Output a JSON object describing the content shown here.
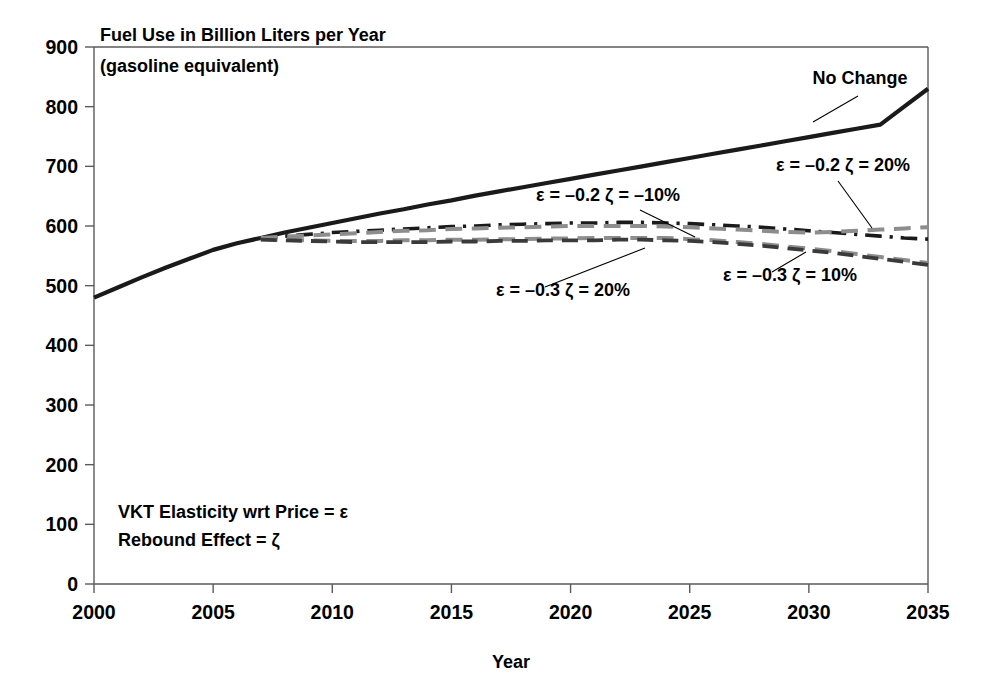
{
  "chart_data": {
    "type": "line",
    "title": "Fuel Use in Billion Liters per Year",
    "subtitle": "(gasoline equivalent)",
    "xlabel": "Year",
    "ylabel": "",
    "xlim": [
      2000,
      2035
    ],
    "ylim": [
      0,
      900
    ],
    "grid": false,
    "legend_position": "inline-annotations",
    "x_ticks": [
      "2000",
      "2005",
      "2010",
      "2015",
      "2020",
      "2025",
      "2030",
      "2035"
    ],
    "y_ticks": [
      "0",
      "100",
      "200",
      "300",
      "400",
      "500",
      "600",
      "700",
      "800",
      "900"
    ],
    "x": [
      2000,
      2001,
      2002,
      2003,
      2004,
      2005,
      2006,
      2007,
      2008,
      2009,
      2010,
      2011,
      2012,
      2013,
      2014,
      2015,
      2016,
      2017,
      2018,
      2019,
      2020,
      2021,
      2022,
      2023,
      2024,
      2025,
      2026,
      2027,
      2028,
      2029,
      2030,
      2031,
      2032,
      2033,
      2034,
      2035
    ],
    "series": [
      {
        "name": "No Change",
        "color": "#1a1a1a",
        "style": "solid",
        "width": 4.2,
        "values": [
          480,
          497,
          514,
          530,
          545,
          560,
          571,
          580,
          589,
          597,
          605,
          613,
          621,
          628,
          636,
          643,
          651,
          658,
          665,
          672,
          679,
          686,
          693,
          700,
          707,
          714,
          721,
          728,
          735,
          742,
          749,
          756,
          763,
          770,
          800,
          830
        ]
      },
      {
        "name": "ε = –0.2 ζ = –10%",
        "color": "#1a1a1a",
        "style": "dashdot",
        "width": 3.6,
        "values": [
          null,
          null,
          null,
          null,
          null,
          null,
          null,
          580,
          583,
          586,
          589,
          591,
          593,
          595,
          597,
          599,
          600,
          602,
          603,
          604,
          605,
          605,
          606,
          606,
          605,
          604,
          602,
          600,
          598,
          595,
          592,
          589,
          586,
          583,
          580,
          578
        ]
      },
      {
        "name": "ε = –0.2 ζ = 20%",
        "color": "#8d8d8d",
        "style": "dashed",
        "width": 4.0,
        "values": [
          null,
          null,
          null,
          null,
          null,
          null,
          null,
          580,
          582,
          584,
          586,
          588,
          590,
          592,
          593,
          595,
          596,
          597,
          598,
          599,
          600,
          600,
          600,
          600,
          599,
          598,
          596,
          594,
          592,
          590,
          589,
          590,
          592,
          594,
          596,
          598
        ]
      },
      {
        "name": "ε = –0.3 ζ = 20%",
        "color": "#8d8d8d",
        "style": "dashed",
        "width": 4.0,
        "values": [
          null,
          null,
          null,
          null,
          null,
          null,
          null,
          578,
          577,
          576,
          575,
          575,
          575,
          576,
          576,
          577,
          577,
          578,
          578,
          579,
          579,
          580,
          580,
          580,
          580,
          578,
          576,
          573,
          570,
          566,
          562,
          558,
          553,
          548,
          543,
          538
        ]
      },
      {
        "name": "ε = –0.3 ζ = 10%",
        "color": "#3a3a3a",
        "style": "dashed",
        "width": 3.8,
        "values": [
          null,
          null,
          null,
          null,
          null,
          null,
          null,
          577,
          576,
          575,
          574,
          573,
          573,
          573,
          573,
          574,
          574,
          575,
          575,
          576,
          576,
          576,
          577,
          577,
          576,
          575,
          573,
          570,
          567,
          563,
          559,
          555,
          550,
          545,
          540,
          535
        ]
      }
    ],
    "annotations": [
      {
        "id": "no-change",
        "text": "No Change",
        "x": 860,
        "y": 84,
        "anchor": "middle",
        "leader": [
          [
            858,
            96
          ],
          [
            813,
            122
          ]
        ]
      },
      {
        "id": "eps-02-zeta-neg10",
        "text": "ε = –0.2 ζ = –10%",
        "x": 608,
        "y": 201,
        "anchor": "middle",
        "leader": [
          [
            640,
            210
          ],
          [
            695,
            237
          ]
        ]
      },
      {
        "id": "eps-02-zeta-20",
        "text": "ε = –0.2 ζ = 20%",
        "x": 843,
        "y": 171,
        "anchor": "middle",
        "leader": [
          [
            838,
            181
          ],
          [
            872,
            228
          ]
        ]
      },
      {
        "id": "eps-03-zeta-20",
        "text": "ε = –0.3 ζ = 20%",
        "x": 563,
        "y": 296,
        "anchor": "middle",
        "leader": [
          [
            545,
            287
          ],
          [
            645,
            248
          ]
        ]
      },
      {
        "id": "eps-03-zeta-10",
        "text": "ε = –0.3 ζ = 10%",
        "x": 790,
        "y": 281,
        "anchor": "middle",
        "leader": [
          [
            772,
            272
          ],
          [
            806,
            252
          ]
        ]
      }
    ],
    "notes": [
      "VKT Elasticity wrt Price = ε",
      "Rebound Effect = ζ"
    ]
  }
}
